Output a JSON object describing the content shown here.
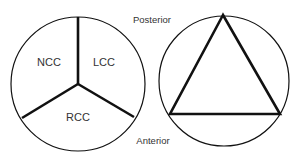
{
  "left_diagram": {
    "labels": {
      "ncc": "NCC",
      "lcc": "LCC",
      "rcc": "RCC"
    }
  },
  "right_diagram": {
    "labels": {
      "top": "Posterior",
      "bottom": "Anterior"
    }
  },
  "colors": {
    "stroke": "#111111",
    "text": "#333333",
    "background": "#ffffff"
  }
}
